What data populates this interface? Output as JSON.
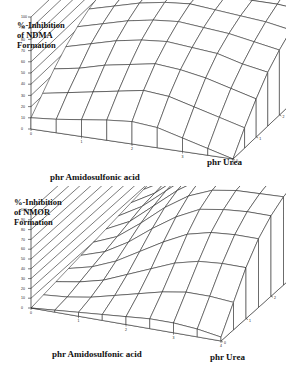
{
  "chart_data": [
    {
      "type": "surface",
      "title": "%-Inhibition of NDMA Formation",
      "zlabel": "%-Inhibition\nof NDMA\nFormation",
      "xlabel": "phr Amidosulfonic acid",
      "ylabel": "phr Urea",
      "zlim": [
        0,
        100
      ],
      "z_ticks": [
        "100",
        "90",
        "80",
        "70",
        "60",
        "50",
        "40",
        "30",
        "20",
        "10",
        "0"
      ],
      "x_ticks": [
        "0",
        "1",
        "2",
        "3",
        "4"
      ],
      "y_ticks": [
        "0",
        "1",
        "2",
        "3",
        "4",
        "5"
      ],
      "grid": true,
      "x": [
        0,
        0.5,
        1,
        1.5,
        2,
        2.5,
        3,
        3.5,
        4
      ],
      "y": [
        0,
        0.5,
        1,
        1.5,
        2,
        2.5,
        3,
        3.5,
        4,
        4.5,
        5
      ],
      "z": [
        [
          10,
          22,
          34,
          44,
          52,
          58,
          62,
          64,
          65,
          66,
          66
        ],
        [
          12,
          26,
          38,
          50,
          58,
          64,
          67,
          68,
          69,
          70,
          70
        ],
        [
          15,
          30,
          44,
          56,
          64,
          70,
          72,
          73,
          73,
          74,
          74
        ],
        [
          18,
          34,
          48,
          60,
          68,
          74,
          76,
          76,
          76,
          77,
          77
        ],
        [
          20,
          38,
          52,
          62,
          70,
          76,
          78,
          78,
          78,
          79,
          79
        ],
        [
          18,
          36,
          50,
          60,
          68,
          74,
          78,
          79,
          80,
          81,
          82
        ],
        [
          12,
          30,
          46,
          58,
          66,
          72,
          76,
          80,
          82,
          84,
          86
        ],
        [
          6,
          24,
          40,
          52,
          62,
          70,
          76,
          82,
          86,
          90,
          94
        ],
        [
          0,
          18,
          34,
          48,
          58,
          66,
          74,
          82,
          88,
          94,
          100
        ]
      ]
    },
    {
      "type": "surface",
      "title": "%-Inhibition of NMOR Formation",
      "zlabel": "%-Inhibition\nof NMOR\nFormation",
      "xlabel": "phr Amidosulfonic acid",
      "ylabel": "phr Urea",
      "zlim": [
        0,
        100
      ],
      "z_ticks": [
        "100",
        "90",
        "80",
        "70",
        "60",
        "50",
        "40",
        "30",
        "20",
        "10",
        "0"
      ],
      "x_ticks": [
        "0",
        "1",
        "2",
        "3",
        "4"
      ],
      "y_ticks": [
        "0",
        "1",
        "2",
        "3",
        "4",
        "5"
      ],
      "grid": true,
      "x": [
        0,
        0.5,
        1,
        1.5,
        2,
        2.5,
        3,
        3.5,
        4
      ],
      "y": [
        0,
        0.5,
        1,
        1.5,
        2,
        2.5,
        3,
        3.5,
        4,
        4.5,
        5
      ],
      "z": [
        [
          0,
          2,
          4,
          6,
          8,
          10,
          12,
          14,
          16,
          18,
          20
        ],
        [
          2,
          4,
          8,
          12,
          16,
          20,
          24,
          28,
          30,
          32,
          34
        ],
        [
          4,
          8,
          14,
          22,
          30,
          38,
          44,
          48,
          50,
          52,
          54
        ],
        [
          6,
          14,
          24,
          36,
          48,
          58,
          64,
          68,
          70,
          72,
          74
        ],
        [
          8,
          20,
          34,
          50,
          64,
          74,
          80,
          83,
          85,
          86,
          88
        ],
        [
          10,
          26,
          44,
          62,
          76,
          84,
          88,
          90,
          91,
          92,
          93
        ],
        [
          10,
          30,
          50,
          68,
          80,
          88,
          91,
          93,
          94,
          95,
          96
        ],
        [
          8,
          30,
          52,
          70,
          82,
          89,
          93,
          95,
          96,
          97,
          98
        ],
        [
          4,
          28,
          52,
          70,
          82,
          90,
          94,
          96,
          98,
          99,
          100
        ]
      ]
    }
  ]
}
